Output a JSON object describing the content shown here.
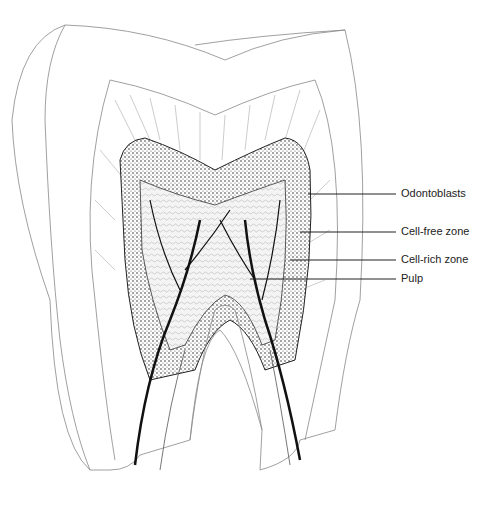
{
  "figure": {
    "labels": [
      {
        "id": "odontoblasts",
        "text": "Odontoblasts",
        "y": 194,
        "line_x1": 308
      },
      {
        "id": "cell-free",
        "text": "Cell-free zone",
        "y": 232,
        "line_x1": 300
      },
      {
        "id": "cell-rich",
        "text": "Cell-rich zone",
        "y": 260,
        "line_x1": 290
      },
      {
        "id": "pulp",
        "text": "Pulp",
        "y": 279,
        "line_x1": 250
      }
    ]
  },
  "colors": {
    "ink": "#1a1a1a",
    "outline": "#777777",
    "background": "#ffffff"
  }
}
